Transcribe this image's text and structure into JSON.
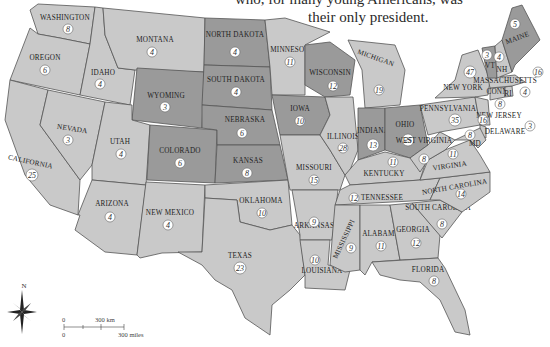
{
  "caption": {
    "line1": "who, for many young Americans, was",
    "line2": "their only president."
  },
  "map": {
    "title": "United States electoral votes by state",
    "colors": {
      "light": "#c9c9c9",
      "mid": "#bdbdbd",
      "dark": "#9a9a9a",
      "border": "#555555"
    },
    "states": [
      {
        "id": "WA",
        "label": "WASHINGTON",
        "votes": "8",
        "shade": "light"
      },
      {
        "id": "OR",
        "label": "OREGON",
        "votes": "6",
        "shade": "light"
      },
      {
        "id": "CA",
        "label": "CALIFORNIA",
        "votes": "25",
        "shade": "light"
      },
      {
        "id": "ID",
        "label": "IDAHO",
        "votes": "4",
        "shade": "light"
      },
      {
        "id": "NV",
        "label": "NEVADA",
        "votes": "3",
        "shade": "light"
      },
      {
        "id": "MT",
        "label": "MONTANA",
        "votes": "4",
        "shade": "light"
      },
      {
        "id": "WY",
        "label": "WYOMING",
        "votes": "3",
        "shade": "dark"
      },
      {
        "id": "UT",
        "label": "UTAH",
        "votes": "4",
        "shade": "light"
      },
      {
        "id": "AZ",
        "label": "ARIZONA",
        "votes": "4",
        "shade": "light"
      },
      {
        "id": "CO",
        "label": "COLORADO",
        "votes": "6",
        "shade": "dark"
      },
      {
        "id": "NM",
        "label": "NEW MEXICO",
        "votes": "4",
        "shade": "light"
      },
      {
        "id": "ND",
        "label": "NORTH DAKOTA",
        "votes": "4",
        "shade": "dark"
      },
      {
        "id": "SD",
        "label": "SOUTH DAKOTA",
        "votes": "4",
        "shade": "dark"
      },
      {
        "id": "NE",
        "label": "NEBRASKA",
        "votes": "6",
        "shade": "dark"
      },
      {
        "id": "KS",
        "label": "KANSAS",
        "votes": "8",
        "shade": "dark"
      },
      {
        "id": "OK",
        "label": "OKLAHOMA",
        "votes": "10",
        "shade": "light"
      },
      {
        "id": "TX",
        "label": "TEXAS",
        "votes": "23",
        "shade": "light"
      },
      {
        "id": "MN",
        "label": "MINNESOTA",
        "votes": "11",
        "shade": "light"
      },
      {
        "id": "IA",
        "label": "IOWA",
        "votes": "10",
        "shade": "dark"
      },
      {
        "id": "MO",
        "label": "MISSOURI",
        "votes": "15",
        "shade": "light"
      },
      {
        "id": "AR",
        "label": "ARKANSAS",
        "votes": "9",
        "shade": "light"
      },
      {
        "id": "LA",
        "label": "LOUISIANA",
        "votes": "10",
        "shade": "light"
      },
      {
        "id": "WI",
        "label": "WISCONSIN",
        "votes": "12",
        "shade": "dark"
      },
      {
        "id": "IL",
        "label": "ILLINOIS",
        "votes": "28",
        "shade": "light"
      },
      {
        "id": "MI",
        "label": "MICHIGAN",
        "votes": "19",
        "shade": "light"
      },
      {
        "id": "IN",
        "label": "INDIANA",
        "votes": "13",
        "shade": "dark"
      },
      {
        "id": "OH",
        "label": "OHIO",
        "votes": "25",
        "shade": "dark"
      },
      {
        "id": "KY",
        "label": "KENTUCKY",
        "votes": "11",
        "shade": "light"
      },
      {
        "id": "TN",
        "label": "TENNESSEE",
        "votes": "12",
        "shade": "light"
      },
      {
        "id": "MS",
        "label": "MISSISSIPPI",
        "votes": "9",
        "shade": "light"
      },
      {
        "id": "AL",
        "label": "ALABAMA",
        "votes": "11",
        "shade": "light"
      },
      {
        "id": "GA",
        "label": "GEORGIA",
        "votes": "12",
        "shade": "light"
      },
      {
        "id": "FL",
        "label": "FLORIDA",
        "votes": "8",
        "shade": "light"
      },
      {
        "id": "SC",
        "label": "SOUTH CAROLINA",
        "votes": "8",
        "shade": "light"
      },
      {
        "id": "NC",
        "label": "NORTH CAROLINA",
        "votes": "14",
        "shade": "light"
      },
      {
        "id": "VA",
        "label": "VIRGINIA",
        "votes": "11",
        "shade": "light"
      },
      {
        "id": "WV",
        "label": "WEST VIRGINIA",
        "votes": "8",
        "shade": "light"
      },
      {
        "id": "PA",
        "label": "PENNSYLVANIA",
        "votes": "35",
        "shade": "light"
      },
      {
        "id": "NY",
        "label": "NEW YORK",
        "votes": "47",
        "shade": "light"
      },
      {
        "id": "NJ",
        "label": "NEW JERSEY",
        "votes": "16",
        "shade": "light"
      },
      {
        "id": "DE",
        "label": "DELAWARE",
        "votes": "3",
        "shade": "light"
      },
      {
        "id": "MD",
        "label": "MD",
        "votes": "8",
        "shade": "light"
      },
      {
        "id": "CT",
        "label": "CONN",
        "votes": "8",
        "shade": "light"
      },
      {
        "id": "RI",
        "label": "RI",
        "votes": "4",
        "shade": "light"
      },
      {
        "id": "MA",
        "label": "MASSACHUSETTS",
        "votes": "16",
        "shade": "light"
      },
      {
        "id": "VT",
        "label": "VT",
        "votes": "3",
        "shade": "dark"
      },
      {
        "id": "NH",
        "label": "NH",
        "votes": "4",
        "shade": "light"
      },
      {
        "id": "ME",
        "label": "MAINE",
        "votes": "5",
        "shade": "dark"
      }
    ],
    "compass": {
      "label": "N"
    },
    "scale": {
      "km_start": "0",
      "km_label": "300 km",
      "mi_start": "0",
      "mi_label": "300 miles"
    }
  }
}
